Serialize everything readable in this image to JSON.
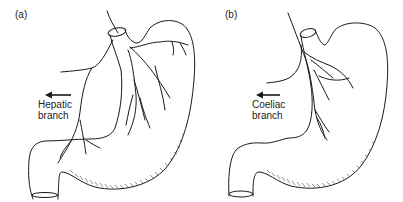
{
  "panels": [
    {
      "id": "a",
      "label": "(a)",
      "branch_label_line1": "Hepatic",
      "branch_label_line2": "branch",
      "arrow_direction": "left"
    },
    {
      "id": "b",
      "label": "(b)",
      "branch_label_line1": "Coeliac",
      "branch_label_line2": "branch",
      "arrow_direction": "left"
    }
  ],
  "colors": {
    "stroke": "#1a1a1a",
    "background": "#ffffff",
    "text": "#222222"
  }
}
